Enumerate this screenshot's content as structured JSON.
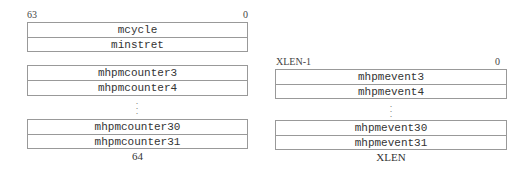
{
  "left": {
    "msb_label": "63",
    "lsb_label": "0",
    "group1": [
      "mcycle",
      "minstret"
    ],
    "group2": [
      "mhpmcounter3",
      "mhpmcounter4"
    ],
    "group3": [
      "mhpmcounter30",
      "mhpmcounter31"
    ],
    "ellipsis": "⋮",
    "width_label": "64"
  },
  "right": {
    "msb_label": "XLEN-1",
    "lsb_label": "0",
    "group1": [
      "mhpmevent3",
      "mhpmevent4"
    ],
    "group2": [
      "mhpmevent30",
      "mhpmevent31"
    ],
    "ellipsis": "⋮",
    "width_label": "XLEN"
  }
}
